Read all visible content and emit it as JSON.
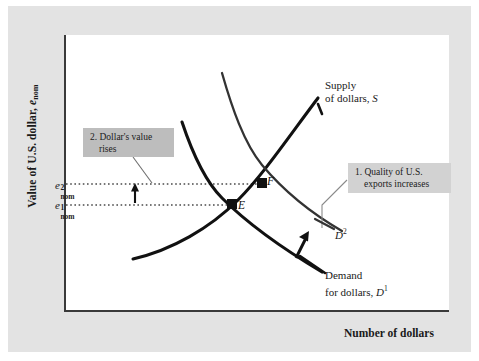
{
  "figure": {
    "type": "economics-supply-demand-diagram",
    "axes": {
      "y_title_prefix": "Value of U.S. dollar, ",
      "y_title_symbol": "e",
      "y_title_sub": "nom",
      "x_title": "Number of dollars"
    },
    "y_ticks": [
      {
        "base": "e",
        "sup": "2",
        "sub": "nom",
        "value_name": "e2_nom"
      },
      {
        "base": "e",
        "sup": "1",
        "sub": "nom",
        "value_name": "e1_nom"
      }
    ],
    "callouts": [
      {
        "id": "quality-exports",
        "line1": "1. Quality of U.S.",
        "line2": "exports increases"
      },
      {
        "id": "dollar-value-rises",
        "line1": "2. Dollar's value",
        "line2": "rises"
      }
    ],
    "curves": [
      {
        "id": "supply",
        "label_line1": "Supply",
        "label_line2_prefix": "of dollars, ",
        "label_line2_symbol": "S"
      },
      {
        "id": "demand1",
        "label_line1": "Demand",
        "label_line2_prefix": "for dollars, ",
        "label_line2_symbol": "D",
        "label_line2_sup": "1"
      },
      {
        "id": "demand2",
        "label_symbol": "D",
        "label_sup": "2"
      }
    ],
    "points": [
      {
        "id": "E",
        "label": "E",
        "description": "initial equilibrium"
      },
      {
        "id": "F",
        "label": "F",
        "description": "new equilibrium"
      }
    ],
    "colors": {
      "page_background": "#e3e3e3",
      "plot_background": "#ffffff",
      "curve_stroke": "#111111",
      "callout_fill_dark": "#bdbdbd",
      "callout_fill_light": "#d2d2d2",
      "axis_stroke": "#3a3a3a",
      "dotted_line": "#4a4a4a"
    }
  }
}
